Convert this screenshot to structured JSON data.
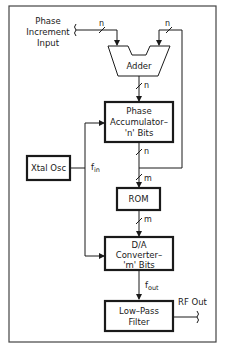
{
  "diagram": {
    "inputs": {
      "phase_increment": [
        "Phase",
        "Increment",
        "Input"
      ]
    },
    "blocks": {
      "adder": {
        "label": "Adder"
      },
      "phase_accumulator": {
        "lines": [
          "Phase",
          "Accumulator–",
          "'n' Bits"
        ]
      },
      "xtal_osc": {
        "label": "Xtal Osc"
      },
      "rom": {
        "label": "ROM"
      },
      "dac": {
        "lines": [
          "D/A",
          "Converter–",
          "'m' Bits"
        ]
      },
      "lpf": {
        "lines": [
          "Low–Pass",
          "Filter"
        ]
      }
    },
    "bus_labels": {
      "input_bus": "n",
      "feedback_bus": "n",
      "adder_out": "n",
      "acc_out": "n",
      "rom_in": "m",
      "rom_out": "m"
    },
    "signals": {
      "fin": {
        "main": "f",
        "sub": "in"
      },
      "fout": {
        "main": "f",
        "sub": "out"
      },
      "rf_out": "RF Out"
    },
    "colors": {
      "line": "#1a1a1a",
      "border": "#444444",
      "background": "#ffffff"
    }
  }
}
